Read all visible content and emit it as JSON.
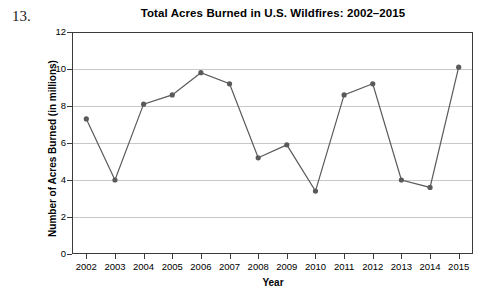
{
  "problem": {
    "number": "13."
  },
  "chart_data": {
    "type": "line",
    "title": "Total Acres Burned in U.S. Wildfires: 2002–2015",
    "xlabel": "Year",
    "ylabel": "Number of Acres Burned (in millions)",
    "categories": [
      "2002",
      "2003",
      "2004",
      "2005",
      "2006",
      "2007",
      "2008",
      "2009",
      "2010",
      "2011",
      "2012",
      "2013",
      "2014",
      "2015"
    ],
    "values": [
      7.3,
      4.0,
      8.1,
      8.6,
      9.8,
      9.2,
      5.2,
      5.9,
      3.4,
      8.6,
      9.2,
      4.0,
      3.6,
      10.1
    ],
    "ylim": [
      0,
      12
    ],
    "y_ticks": [
      "0",
      "2",
      "4",
      "6",
      "8",
      "10",
      "12"
    ],
    "grid": "horizontal",
    "legend": "none",
    "series_color": "#5a5a5a",
    "marker": "circle",
    "gridline_color": "#c8c8c8",
    "frame_color": "#3b3b3b",
    "background": "#ffffff"
  }
}
